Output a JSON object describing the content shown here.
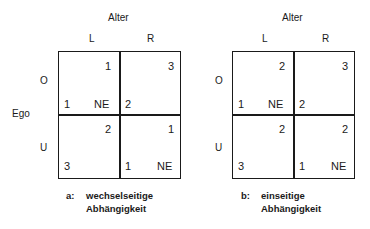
{
  "shared": {
    "column_axis_label": "Alter",
    "row_axis_label": "Ego",
    "columns": [
      "L",
      "R"
    ],
    "rows": [
      "O",
      "U"
    ]
  },
  "matrices": [
    {
      "caption_prefix": "a:",
      "caption_line1": "wechselseitige",
      "caption_line2": "Abhängigkeit",
      "cells": {
        "OL": {
          "alter": "1",
          "ego": "1",
          "ne": "NE"
        },
        "OR": {
          "alter": "3",
          "ego": "2",
          "ne": ""
        },
        "UL": {
          "alter": "2",
          "ego": "3",
          "ne": ""
        },
        "UR": {
          "alter": "1",
          "ego": "1",
          "ne": "NE"
        }
      }
    },
    {
      "caption_prefix": "b:",
      "caption_line1": "einseitige",
      "caption_line2": "Abhängigkeit",
      "cells": {
        "OL": {
          "alter": "2",
          "ego": "1",
          "ne": "NE"
        },
        "OR": {
          "alter": "3",
          "ego": "2",
          "ne": ""
        },
        "UL": {
          "alter": "2",
          "ego": "3",
          "ne": ""
        },
        "UR": {
          "alter": "2",
          "ego": "1",
          "ne": "NE"
        }
      }
    }
  ]
}
